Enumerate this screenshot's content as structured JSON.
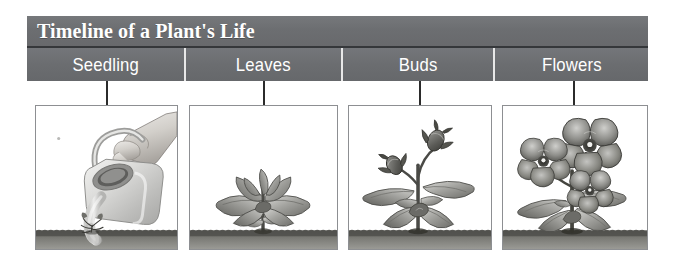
{
  "figure": {
    "title": "Timeline of a Plant's Life",
    "type": "timeline-infographic",
    "accent_color": "#6c6e71",
    "title_text_color": "#ffffff",
    "panel_border_color": "#8d8f92",
    "connector_color": "#2b2b2b",
    "soil_color": "#6a6a66",
    "background_color": "#ffffff"
  },
  "stages": [
    {
      "label": "Seedling",
      "illustration_name": "hand-watering-can-seedling-illustration",
      "description": "A hand tilts a watering can, pouring water onto a tiny sprouting seedling in the soil."
    },
    {
      "label": "Leaves",
      "illustration_name": "plant-with-leaves-illustration",
      "description": "A young plant with a rosette of broad scalloped leaves growing from the soil."
    },
    {
      "label": "Buds",
      "illustration_name": "plant-with-buds-illustration",
      "description": "The plant has grown taller with two closed flower buds rising on slender stems."
    },
    {
      "label": "Flowers",
      "illustration_name": "plant-with-open-flowers-illustration",
      "description": "The mature plant bears three fully opened pansy-like flowers above its leaves."
    }
  ]
}
